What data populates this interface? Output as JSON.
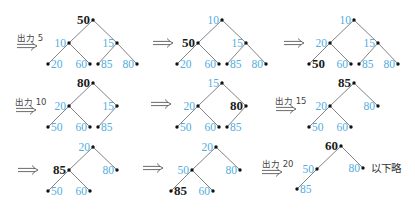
{
  "colors": {
    "highlight": "#1a1a1a",
    "normal": "#52ade0",
    "edge": "#5a5a5a",
    "node_dot": "#111111",
    "caption": "#444444"
  },
  "trees": [
    {
      "step": 1,
      "nodes": [
        {
          "pos": "root",
          "label": "50",
          "color": "#1a1a1a"
        },
        {
          "pos": "left",
          "label": "10",
          "color": "#52ade0"
        },
        {
          "pos": "right",
          "label": "15",
          "color": "#52ade0"
        },
        {
          "pos": "left-left",
          "label": "20",
          "color": "#52ade0"
        },
        {
          "pos": "left-right",
          "label": "60",
          "color": "#52ade0"
        },
        {
          "pos": "right-left",
          "label": "85",
          "color": "#52ade0"
        },
        {
          "pos": "right-right",
          "label": "80",
          "color": "#52ade0"
        }
      ]
    },
    {
      "step": 2,
      "nodes": [
        {
          "pos": "root",
          "label": "10",
          "color": "#52ade0"
        },
        {
          "pos": "left",
          "label": "50",
          "color": "#1a1a1a"
        },
        {
          "pos": "right",
          "label": "15",
          "color": "#52ade0"
        },
        {
          "pos": "left-left",
          "label": "20",
          "color": "#52ade0"
        },
        {
          "pos": "left-right",
          "label": "60",
          "color": "#52ade0"
        },
        {
          "pos": "right-left",
          "label": "85",
          "color": "#52ade0"
        },
        {
          "pos": "right-right",
          "label": "80",
          "color": "#52ade0"
        }
      ]
    },
    {
      "step": 3,
      "nodes": [
        {
          "pos": "root",
          "label": "10",
          "color": "#52ade0"
        },
        {
          "pos": "left",
          "label": "20",
          "color": "#52ade0"
        },
        {
          "pos": "right",
          "label": "15",
          "color": "#52ade0"
        },
        {
          "pos": "left-left",
          "label": "50",
          "color": "#1a1a1a"
        },
        {
          "pos": "left-right",
          "label": "60",
          "color": "#52ade0"
        },
        {
          "pos": "right-left",
          "label": "85",
          "color": "#52ade0"
        },
        {
          "pos": "right-right",
          "label": "80",
          "color": "#52ade0"
        }
      ]
    },
    {
      "step": 4,
      "nodes": [
        {
          "pos": "root",
          "label": "80",
          "color": "#1a1a1a"
        },
        {
          "pos": "left",
          "label": "20",
          "color": "#52ade0"
        },
        {
          "pos": "right",
          "label": "15",
          "color": "#52ade0"
        },
        {
          "pos": "left-left",
          "label": "50",
          "color": "#52ade0"
        },
        {
          "pos": "left-right",
          "label": "60",
          "color": "#52ade0"
        },
        {
          "pos": "right-left",
          "label": "85",
          "color": "#52ade0"
        }
      ]
    },
    {
      "step": 5,
      "nodes": [
        {
          "pos": "root",
          "label": "15",
          "color": "#52ade0"
        },
        {
          "pos": "left",
          "label": "20",
          "color": "#52ade0"
        },
        {
          "pos": "right",
          "label": "80",
          "color": "#1a1a1a"
        },
        {
          "pos": "left-left",
          "label": "50",
          "color": "#52ade0"
        },
        {
          "pos": "left-right",
          "label": "60",
          "color": "#52ade0"
        },
        {
          "pos": "right-left",
          "label": "85",
          "color": "#52ade0"
        }
      ]
    },
    {
      "step": 6,
      "nodes": [
        {
          "pos": "root",
          "label": "85",
          "color": "#1a1a1a"
        },
        {
          "pos": "left",
          "label": "20",
          "color": "#52ade0"
        },
        {
          "pos": "right",
          "label": "80",
          "color": "#52ade0"
        },
        {
          "pos": "left-left",
          "label": "50",
          "color": "#52ade0"
        },
        {
          "pos": "left-right",
          "label": "60",
          "color": "#52ade0"
        }
      ]
    },
    {
      "step": 7,
      "nodes": [
        {
          "pos": "root",
          "label": "20",
          "color": "#52ade0"
        },
        {
          "pos": "left",
          "label": "85",
          "color": "#1a1a1a"
        },
        {
          "pos": "right",
          "label": "80",
          "color": "#52ade0"
        },
        {
          "pos": "left-left",
          "label": "50",
          "color": "#52ade0"
        },
        {
          "pos": "left-right",
          "label": "60",
          "color": "#52ade0"
        }
      ]
    },
    {
      "step": 8,
      "nodes": [
        {
          "pos": "root",
          "label": "20",
          "color": "#52ade0"
        },
        {
          "pos": "left",
          "label": "50",
          "color": "#52ade0"
        },
        {
          "pos": "right",
          "label": "80",
          "color": "#52ade0"
        },
        {
          "pos": "left-left",
          "label": "85",
          "color": "#1a1a1a"
        },
        {
          "pos": "left-right",
          "label": "60",
          "color": "#52ade0"
        }
      ]
    },
    {
      "step": 9,
      "nodes": [
        {
          "pos": "root",
          "label": "60",
          "color": "#1a1a1a"
        },
        {
          "pos": "left",
          "label": "50",
          "color": "#52ade0"
        },
        {
          "pos": "right",
          "label": "80",
          "color": "#52ade0"
        },
        {
          "pos": "left-left",
          "label": "85",
          "color": "#52ade0"
        }
      ]
    }
  ],
  "arrows": [
    {
      "label": "出力 5"
    },
    {
      "label": ""
    },
    {
      "label": ""
    },
    {
      "label": "出力 10"
    },
    {
      "label": ""
    },
    {
      "label": "出力 15"
    },
    {
      "label": ""
    },
    {
      "label": ""
    },
    {
      "label": "出力 20"
    }
  ],
  "note": "以下略"
}
